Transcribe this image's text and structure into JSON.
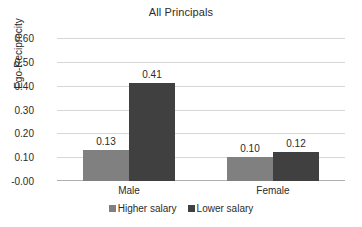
{
  "chart_data": {
    "type": "bar",
    "title": "All Principals",
    "xlabel": "",
    "ylabel": "Ego-Reciprocity",
    "categories": [
      "Male",
      "Female"
    ],
    "series": [
      {
        "name": "Higher salary",
        "values": [
          0.13,
          0.1
        ],
        "color": "#808080"
      },
      {
        "name": "Lower salary",
        "values": [
          0.41,
          0.12
        ],
        "color": "#404040"
      }
    ],
    "value_labels": [
      [
        "0.13",
        "0.10"
      ],
      [
        "0.41",
        "0.12"
      ]
    ],
    "ylim": [
      0.0,
      0.6
    ],
    "ytick_values": [
      0.6,
      0.5,
      0.4,
      0.3,
      0.2,
      0.1,
      0.0
    ],
    "ytick_labels": [
      "0.60",
      "0.50",
      "0.40",
      "0.30",
      "0.20",
      "0.10",
      "-0.00"
    ],
    "grid": true,
    "legend_position": "bottom",
    "background_color": "#ffffff",
    "gridline_color": "#d7d7d7",
    "text_color": "#2b2b2b"
  }
}
